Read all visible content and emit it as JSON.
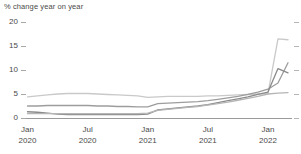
{
  "chart_data": {
    "type": "line",
    "title": "% change year on year",
    "xlabel": "",
    "ylabel": "",
    "ylim": [
      0,
      20
    ],
    "yticks": [
      0,
      5,
      10,
      15,
      20
    ],
    "grid": false,
    "legend": "none",
    "x_tick_labels": [
      {
        "month": "Jan",
        "year": "2020"
      },
      {
        "month": "Jul",
        "year": "2020"
      },
      {
        "month": "Jan",
        "year": "2021"
      },
      {
        "month": "Jul",
        "year": "2021"
      },
      {
        "month": "Jan",
        "year": "2022"
      }
    ],
    "x": [
      "Jan 2020",
      "Feb 2020",
      "Mar 2020",
      "Apr 2020",
      "May 2020",
      "Jun 2020",
      "Jul 2020",
      "Aug 2020",
      "Sep 2020",
      "Oct 2020",
      "Nov 2020",
      "Dec 2020",
      "Jan 2021",
      "Feb 2021",
      "Mar 2021",
      "Apr 2021",
      "May 2021",
      "Jun 2021",
      "Jul 2021",
      "Aug 2021",
      "Sep 2021",
      "Oct 2021",
      "Nov 2021",
      "Dec 2021",
      "Jan 2022",
      "Feb 2022",
      "Mar 2022"
    ],
    "series": [
      {
        "name": "series-1",
        "color": "#c9c9c9",
        "values": [
          4.4,
          4.6,
          4.8,
          5.0,
          5.1,
          5.1,
          5.1,
          5.0,
          4.9,
          4.8,
          4.7,
          4.6,
          4.3,
          4.4,
          4.5,
          4.5,
          4.5,
          4.5,
          4.6,
          4.6,
          4.7,
          4.8,
          4.9,
          5.0,
          5.1,
          16.5,
          16.3
        ]
      },
      {
        "name": "series-2",
        "color": "#9d9d9d",
        "values": [
          2.5,
          2.5,
          2.6,
          2.6,
          2.6,
          2.6,
          2.6,
          2.5,
          2.5,
          2.4,
          2.4,
          2.3,
          2.3,
          3.0,
          3.1,
          3.2,
          3.3,
          3.4,
          3.6,
          3.9,
          4.2,
          4.5,
          4.9,
          5.4,
          6.0,
          7.3,
          11.5
        ]
      },
      {
        "name": "series-3",
        "color": "#8a8a8a",
        "values": [
          1.3,
          1.2,
          1.0,
          0.8,
          0.7,
          0.7,
          0.7,
          0.7,
          0.7,
          0.7,
          0.7,
          0.7,
          0.8,
          1.7,
          1.9,
          2.1,
          2.3,
          2.5,
          2.8,
          3.2,
          3.6,
          4.0,
          4.4,
          4.9,
          5.4,
          10.3,
          9.4
        ]
      },
      {
        "name": "series-4",
        "color": "#b5b5b5",
        "values": [
          0.9,
          0.9,
          0.9,
          0.9,
          0.9,
          0.9,
          0.9,
          0.9,
          0.9,
          0.9,
          0.9,
          0.9,
          1.0,
          1.6,
          1.8,
          2.0,
          2.2,
          2.4,
          2.7,
          3.0,
          3.3,
          3.7,
          4.1,
          4.5,
          5.0,
          5.2,
          5.3
        ]
      }
    ]
  },
  "colors": {
    "axis": "#9a9a9a",
    "tick": "#a8a8a8",
    "text": "#4a4a4a",
    "background": "#ffffff"
  }
}
